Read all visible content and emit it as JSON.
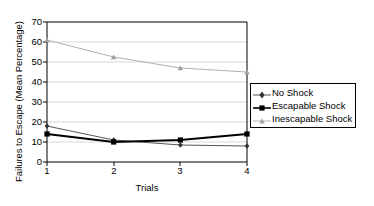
{
  "chart_data": {
    "type": "line",
    "title": "",
    "xlabel": "Trials",
    "ylabel": "Failures to Escape (Mean Percentage)",
    "categories": [
      "1",
      "2",
      "3",
      "4"
    ],
    "x": [
      1,
      2,
      3,
      4
    ],
    "xlim": [
      1,
      4
    ],
    "ylim": [
      0,
      70
    ],
    "yticks": [
      0,
      10,
      20,
      30,
      40,
      50,
      60,
      70
    ],
    "xticks": [
      "1",
      "2",
      "3",
      "4"
    ],
    "grid": "horizontal",
    "legend_position": "right",
    "series": [
      {
        "name": "No Shock",
        "values": [
          18,
          11,
          8.5,
          8
        ],
        "color": "#555555",
        "marker": "diamond",
        "line_width": 1
      },
      {
        "name": "Escapable Shock",
        "values": [
          14,
          10,
          11,
          14
        ],
        "color": "#000000",
        "marker": "square",
        "line_width": 2
      },
      {
        "name": "Inescapable Shock",
        "values": [
          61,
          52.5,
          47,
          45
        ],
        "color": "#b0b0b0",
        "marker": "triangle",
        "line_width": 1
      }
    ]
  },
  "legend": {
    "items": [
      {
        "label": "No Shock"
      },
      {
        "label": "Escapable Shock"
      },
      {
        "label": "Inescapable Shock"
      }
    ]
  },
  "axes": {
    "y_title": "Failures to Escape (Mean Percentage)",
    "x_title": "Trials",
    "y_tick_labels": [
      "70",
      "60",
      "50",
      "40",
      "30",
      "20",
      "10",
      "0"
    ],
    "x_tick_labels": [
      "1",
      "2",
      "3",
      "4"
    ]
  },
  "colors": {
    "axis": "#000000",
    "grid": "#d9d9d9",
    "no_shock": "#555555",
    "escapable_shock": "#000000",
    "inescapable_shock": "#b0b0b0",
    "background": "#ffffff"
  }
}
